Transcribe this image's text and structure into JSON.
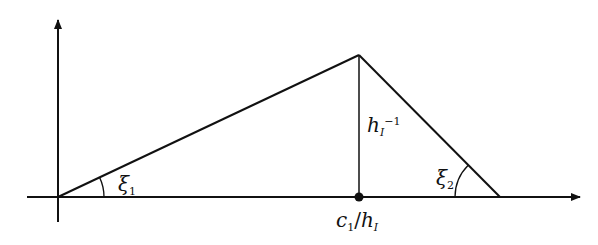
{
  "diagram": {
    "type": "triangle-function-plot",
    "colors": {
      "line": "#111111",
      "background": "#ffffff"
    },
    "axes": {
      "origin": [
        58,
        197
      ],
      "x_axis": {
        "from": 27,
        "to": 580
      },
      "y_axis": {
        "from": 222,
        "to": 20
      }
    },
    "triangle": {
      "left_vertex": [
        58,
        197
      ],
      "apex": [
        359,
        55
      ],
      "right_vertex": [
        500,
        197
      ],
      "foot_point": [
        359,
        197
      ]
    },
    "labels": {
      "angle_left": {
        "symbol": "ξ",
        "sub": "1"
      },
      "angle_right": {
        "symbol": "ξ",
        "sub": "2"
      },
      "height": {
        "base": "h",
        "sub": "I",
        "sup": "−1"
      },
      "foot": {
        "num_base": "c",
        "num_sub": "1",
        "slash": "/",
        "den_base": "h",
        "den_sub": "I"
      }
    }
  }
}
